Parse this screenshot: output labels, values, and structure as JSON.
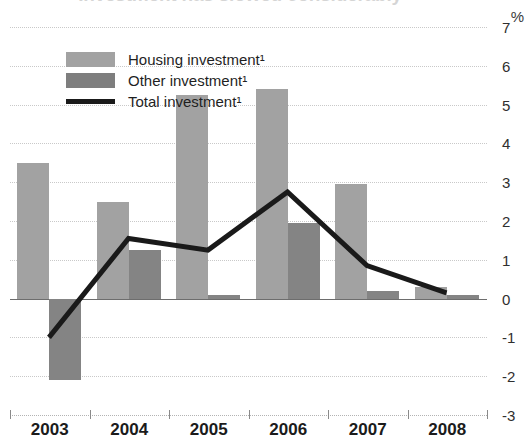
{
  "chart_data": {
    "type": "bar",
    "title": "Investment has slowed considerably",
    "xlabel": "",
    "ylabel": "",
    "unit_label": "%",
    "categories": [
      "2003",
      "2004",
      "2005",
      "2006",
      "2007",
      "2008"
    ],
    "ylim": [
      -3,
      7
    ],
    "yticks": [
      7,
      6,
      5,
      4,
      3,
      2,
      1,
      0,
      -1,
      -2,
      -3
    ],
    "ytick_labels": [
      "7",
      "6",
      "5",
      "4",
      "3",
      "2",
      "1",
      "0",
      "-1",
      "-2",
      "-3"
    ],
    "grid": true,
    "legend_position": "upper-left",
    "series": [
      {
        "name": "Housing investment¹",
        "kind": "bar",
        "color": "#a2a2a2",
        "values": [
          3.5,
          2.5,
          5.25,
          5.4,
          2.95,
          0.3
        ]
      },
      {
        "name": "Other investment¹",
        "kind": "bar",
        "color": "#848484",
        "values": [
          -2.1,
          1.25,
          0.1,
          1.95,
          0.2,
          0.1
        ]
      },
      {
        "name": "Total investment¹",
        "kind": "line",
        "color": "#1a1a1a",
        "values": [
          -1.0,
          1.55,
          1.25,
          2.75,
          0.85,
          0.15
        ]
      }
    ]
  },
  "legend": {
    "items": [
      {
        "label": "Housing investment¹",
        "swatch": "housing-swatch"
      },
      {
        "label": "Other investment¹",
        "swatch": "other-swatch"
      },
      {
        "label": "Total investment¹",
        "swatch": "total-line-swatch"
      }
    ]
  }
}
